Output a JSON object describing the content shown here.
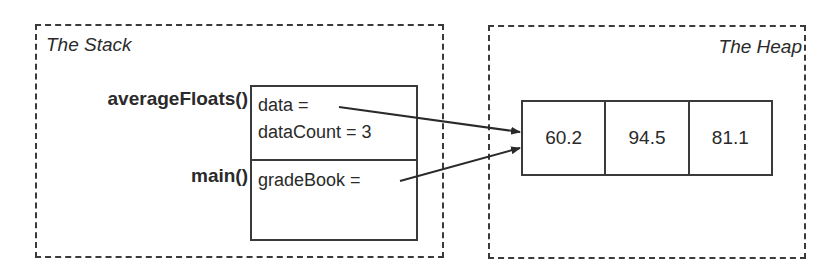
{
  "stack": {
    "title": "The Stack",
    "frames": [
      {
        "function": "averageFloats()",
        "variables": [
          "data =",
          "dataCount = 3"
        ]
      },
      {
        "function": "main()",
        "variables": [
          "gradeBook ="
        ]
      }
    ]
  },
  "heap": {
    "title": "The Heap",
    "array": [
      "60.2",
      "94.5",
      "81.1"
    ]
  },
  "pointers": [
    {
      "from": "averageFloats.data",
      "to": "heap.array[0]"
    },
    {
      "from": "main.gradeBook",
      "to": "heap.array[0]"
    }
  ]
}
